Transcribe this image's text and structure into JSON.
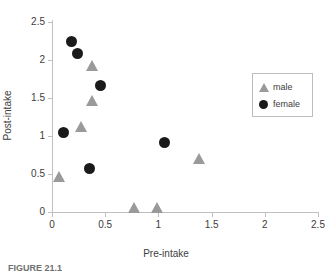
{
  "figure": {
    "caption": "FIGURE 21.1"
  },
  "legend": {
    "position": "right-inside",
    "entries": [
      {
        "label": "male",
        "marker": "triangle-icon",
        "color": "#9a9a9a"
      },
      {
        "label": "female",
        "marker": "circle-icon",
        "color": "#1a1a1a"
      }
    ]
  },
  "axes": {
    "x": {
      "label": "Pre-intake",
      "ticks": [
        "0",
        "0.5",
        "1",
        "1.5",
        "2",
        "2.5"
      ],
      "values": [
        0,
        0.5,
        1,
        1.5,
        2,
        2.5
      ],
      "min": 0,
      "max": 2.5
    },
    "y": {
      "label": "Post-intake",
      "ticks": [
        "0",
        "0.5",
        "1",
        "1.5",
        "2",
        "2.5"
      ],
      "values": [
        0,
        0.5,
        1,
        1.5,
        2,
        2.5
      ],
      "min": 0,
      "max": 2.5
    }
  },
  "chart_data": {
    "type": "scatter",
    "title": "",
    "xlabel": "Pre-intake",
    "ylabel": "Post-intake",
    "xlim": [
      0,
      2.5
    ],
    "ylim": [
      0,
      2.5
    ],
    "xticks": [
      0,
      0.5,
      1,
      1.5,
      2,
      2.5
    ],
    "yticks": [
      0,
      0.5,
      1,
      1.5,
      2,
      2.5
    ],
    "grid": false,
    "legend": "inside-right",
    "series": [
      {
        "name": "male",
        "marker": "triangle",
        "color": "#9a9a9a",
        "points": [
          {
            "x": 0.07,
            "y": 0.47
          },
          {
            "x": 0.27,
            "y": 1.13
          },
          {
            "x": 0.38,
            "y": 1.47
          },
          {
            "x": 0.38,
            "y": 1.93
          },
          {
            "x": 0.77,
            "y": 0.06
          },
          {
            "x": 0.99,
            "y": 0.06
          },
          {
            "x": 1.38,
            "y": 0.71
          }
        ]
      },
      {
        "name": "female",
        "marker": "circle",
        "color": "#1a1a1a",
        "points": [
          {
            "x": 0.11,
            "y": 1.05
          },
          {
            "x": 0.18,
            "y": 2.24
          },
          {
            "x": 0.24,
            "y": 2.08
          },
          {
            "x": 0.35,
            "y": 0.57
          },
          {
            "x": 0.46,
            "y": 1.66
          },
          {
            "x": 1.06,
            "y": 0.92
          }
        ]
      }
    ]
  }
}
